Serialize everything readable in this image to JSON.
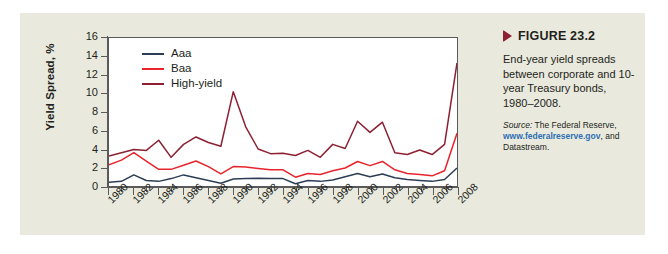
{
  "figure": {
    "marker_icon": "triangle-right-icon",
    "title": "FIGURE 23.2",
    "caption": "End-year yield spreads between corporate and 10-year Treasury bonds, 1980–2008.",
    "source_label": "Source:",
    "source_pre": " The Federal Reserve,",
    "source_link": "www.federalreserve.gov",
    "source_post": ", and Datastream."
  },
  "colors": {
    "panel_bg": "#e9e9dd",
    "plot_bg": "#ffffff",
    "axis": "#5a5a5a",
    "aaa": "#2c3e56",
    "baa": "#e8242c",
    "high_yield": "#8d2032",
    "marker": "#8d2032",
    "link": "#2f6fb5"
  },
  "chart_data": {
    "type": "line",
    "title": "",
    "xlabel": "",
    "ylabel": "Yield Spread, %",
    "xlim": [
      1980,
      2008
    ],
    "ylim": [
      0,
      16
    ],
    "ytick_values": [
      0,
      2,
      4,
      6,
      8,
      10,
      12,
      14,
      16
    ],
    "ytick_labels": [
      "0",
      "2",
      "4",
      "6",
      "8",
      "10",
      "12",
      "14",
      "16"
    ],
    "xtick_major": [
      1980,
      1982,
      1984,
      1986,
      1988,
      1990,
      1992,
      1994,
      1996,
      1998,
      2000,
      2002,
      2004,
      2006,
      2008
    ],
    "xtick_major_labels": [
      "1980",
      "1982",
      "1984",
      "1986",
      "1988",
      "1990",
      "1992",
      "1994",
      "1996",
      "1998",
      "2000",
      "2002",
      "2004",
      "2006",
      "2008"
    ],
    "xtick_minor_step": 1,
    "grid": false,
    "legend_position": "top-left",
    "x": [
      1980,
      1981,
      1982,
      1983,
      1984,
      1985,
      1986,
      1987,
      1988,
      1989,
      1990,
      1991,
      1992,
      1993,
      1994,
      1995,
      1996,
      1997,
      1998,
      1999,
      2000,
      2001,
      2002,
      2003,
      2004,
      2005,
      2006,
      2007,
      2008
    ],
    "series": [
      {
        "name": "Aaa",
        "color": "#2c3e56",
        "values": [
          0.4,
          0.5,
          1.2,
          0.6,
          0.5,
          0.8,
          1.2,
          0.9,
          0.6,
          0.3,
          0.75,
          0.8,
          0.85,
          0.8,
          0.8,
          0.25,
          0.6,
          0.5,
          0.65,
          1.0,
          1.35,
          1.0,
          1.3,
          0.9,
          0.7,
          0.6,
          0.5,
          0.7,
          1.95
        ]
      },
      {
        "name": "Baa",
        "color": "#e8242c",
        "values": [
          2.3,
          2.8,
          3.6,
          2.7,
          1.8,
          1.8,
          2.25,
          2.7,
          2.1,
          1.3,
          2.1,
          2.05,
          1.9,
          1.75,
          1.75,
          0.95,
          1.35,
          1.25,
          1.65,
          1.95,
          2.65,
          2.2,
          2.65,
          1.75,
          1.35,
          1.25,
          1.1,
          1.65,
          5.7
        ]
      },
      {
        "name": "High-yield",
        "color": "#8d2032",
        "values": [
          3.25,
          3.6,
          3.95,
          3.85,
          4.95,
          3.1,
          4.5,
          5.3,
          4.7,
          4.3,
          10.2,
          6.4,
          4.0,
          3.5,
          3.55,
          3.3,
          3.85,
          3.1,
          4.5,
          4.05,
          7.0,
          5.8,
          6.9,
          3.6,
          3.4,
          3.9,
          3.4,
          4.5,
          13.3
        ]
      }
    ]
  }
}
